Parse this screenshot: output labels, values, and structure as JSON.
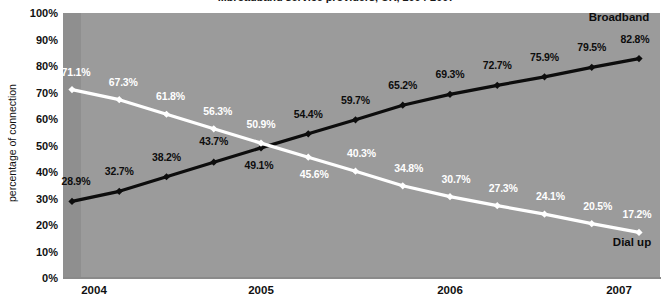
{
  "chart_data": {
    "type": "line",
    "title": "...broadband service providers, UK, 2004-2007",
    "xlabel": "",
    "ylabel": "percentage of connection",
    "ylim": [
      0,
      100
    ],
    "grid": false,
    "legend_position": "inline-end-of-line",
    "x": [
      "2004 Q1",
      "2004 Q2",
      "2004 Q3",
      "2004 Q4",
      "2005 Q1",
      "2005 Q2",
      "2005 Q3",
      "2005 Q4",
      "2006 Q1",
      "2006 Q2",
      "2006 Q3",
      "2006 Q4",
      "2007 Q1"
    ],
    "x_tick_labels": [
      "2004",
      "2005",
      "2006",
      "2007"
    ],
    "x_tick_indices": [
      0,
      4,
      8,
      12
    ],
    "y_tick_labels": [
      "0%",
      "10%",
      "20%",
      "30%",
      "40%",
      "50%",
      "60%",
      "70%",
      "80%",
      "90%",
      "100%"
    ],
    "y_tick_values": [
      0,
      10,
      20,
      30,
      40,
      50,
      60,
      70,
      80,
      90,
      100
    ],
    "series": [
      {
        "name": "Broadband",
        "color": "#0d0d0d",
        "values": [
          28.9,
          32.7,
          38.2,
          43.7,
          49.1,
          54.4,
          59.7,
          65.2,
          69.3,
          72.7,
          75.9,
          79.5,
          82.8
        ],
        "labels": [
          "28.9%",
          "32.7%",
          "38.2%",
          "43.7%",
          "49.1%",
          "54.4%",
          "59.7%",
          "65.2%",
          "69.3%",
          "72.7%",
          "75.9%",
          "79.5%",
          "82.8%"
        ],
        "label_offsets": [
          {
            "dx": 4,
            "dy": -20
          },
          {
            "dx": 0,
            "dy": -20
          },
          {
            "dx": 0,
            "dy": -20
          },
          {
            "dx": 0,
            "dy": -21
          },
          {
            "dx": -2,
            "dy": 17
          },
          {
            "dx": 0,
            "dy": -20
          },
          {
            "dx": 0,
            "dy": -20
          },
          {
            "dx": 0,
            "dy": -20
          },
          {
            "dx": 0,
            "dy": -20
          },
          {
            "dx": 0,
            "dy": -20
          },
          {
            "dx": 0,
            "dy": -20
          },
          {
            "dx": 0,
            "dy": -20
          },
          {
            "dx": -4,
            "dy": -20
          }
        ]
      },
      {
        "name": "Dial up",
        "color": "#ffffff",
        "values": [
          71.1,
          67.3,
          61.8,
          56.3,
          50.9,
          45.6,
          40.3,
          34.8,
          30.7,
          27.3,
          24.1,
          20.5,
          17.2
        ],
        "labels": [
          "71.1%",
          "67.3%",
          "61.8%",
          "56.3%",
          "50.9%",
          "45.6%",
          "40.3%",
          "34.8%",
          "30.7%",
          "27.3%",
          "24.1%",
          "20.5%",
          "17.2%"
        ],
        "label_offsets": [
          {
            "dx": 4,
            "dy": -18
          },
          {
            "dx": 4,
            "dy": -18
          },
          {
            "dx": 4,
            "dy": -18
          },
          {
            "dx": 4,
            "dy": -18
          },
          {
            "dx": 0,
            "dy": -19
          },
          {
            "dx": 6,
            "dy": 17
          },
          {
            "dx": 6,
            "dy": -18
          },
          {
            "dx": 6,
            "dy": -18
          },
          {
            "dx": 6,
            "dy": -18
          },
          {
            "dx": 6,
            "dy": -18
          },
          {
            "dx": 6,
            "dy": -18
          },
          {
            "dx": 6,
            "dy": -18
          },
          {
            "dx": -2,
            "dy": -18
          }
        ]
      }
    ],
    "series_end_labels": [
      {
        "name": "Broadband",
        "x_px": 619,
        "y_px": 17
      },
      {
        "name": "Dial up",
        "x_px": 632,
        "y_px": 242
      }
    ],
    "colors": {
      "plot_background": "#9b9b9b",
      "plot_background_band": "#8f8f8f",
      "broadband": "#0d0d0d",
      "dialup": "#ffffff",
      "page_background": "#ffffff",
      "text": "#111111"
    }
  }
}
